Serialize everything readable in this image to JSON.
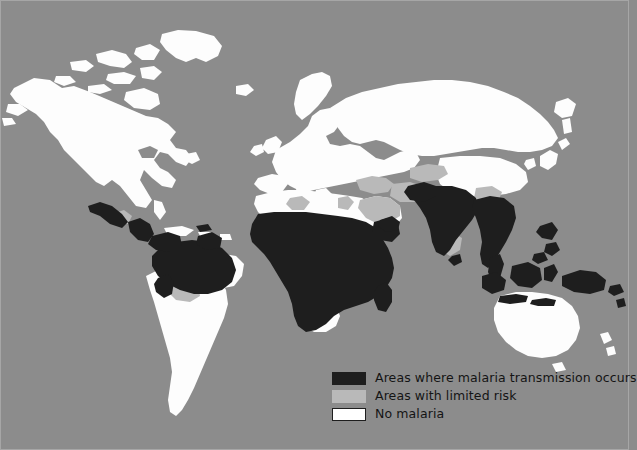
{
  "figure": {
    "name": "world-malaria-transmission-map",
    "projection": "world map",
    "background_color": "#8c8c8c",
    "frame_color": "#a6a6a6"
  },
  "legend": {
    "items": [
      {
        "label": "Areas where malaria transmission occurs",
        "color": "#1e1e1e",
        "border": "none",
        "key": "transmission"
      },
      {
        "label": "Areas with limited risk",
        "color": "#b9b9b9",
        "border": "none",
        "key": "limited-risk"
      },
      {
        "label": "No malaria",
        "color": "#ffffff",
        "border": "1px solid #1e1e1e",
        "key": "no-malaria"
      }
    ]
  },
  "colors": {
    "ocean": "#8c8c8c",
    "land_no_malaria": "#fdfdfd",
    "transmission": "#1e1e1e",
    "limited_risk": "#b9b9b9",
    "text": "#141414"
  },
  "regions": {
    "transmission": [
      "Sub-Saharan Africa",
      "Amazon Basin (Brazil, Colombia, Venezuela, Guyana)",
      "Central America (Guatemala, Honduras, Nicaragua)",
      "Mexico west coast",
      "Peru / Ecuador lowlands",
      "Madagascar",
      "South Asia (India, Pakistan, Bangladesh)",
      "Southeast Asia (Myanmar, Thailand, Laos, Vietnam, Cambodia)",
      "Indonesia",
      "Philippines",
      "Papua New Guinea",
      "Yemen / Oman coast"
    ],
    "limited_risk": [
      "North Africa fringe (Algeria, Libya, Egypt)",
      "Arabian Peninsula (Saudi Arabia)",
      "Iran / Iraq",
      "Turkey southeast",
      "Central Asia",
      "Southern India coast",
      "Argentina north",
      "Bolivia"
    ],
    "no_malaria": [
      "North America",
      "Europe",
      "Russia",
      "Australia",
      "Japan",
      "Chile / Argentina south",
      "South Africa",
      "North Africa coast"
    ]
  }
}
